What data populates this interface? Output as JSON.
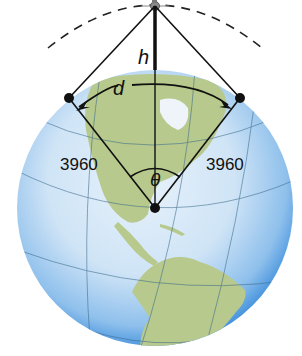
{
  "diagram": {
    "labels": {
      "height": "h",
      "arc_distance": "d",
      "radius_left": "3960",
      "radius_right": "3960",
      "angle": "θ"
    },
    "colors": {
      "ocean": "#5aa6e6",
      "ocean_light": "#cfe6f7",
      "land": "#b6c98a",
      "line": "#111111",
      "dashed_orbit": "#222222"
    }
  }
}
